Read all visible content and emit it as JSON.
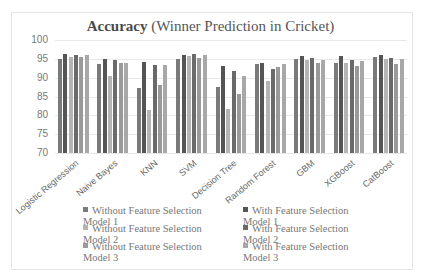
{
  "chart_data": {
    "type": "bar",
    "title": "Accuracy (Winner Prediction in Cricket)",
    "title_bold_part": "Accuracy",
    "title_rest": " (Winner Prediction in Cricket)",
    "xlabel": "",
    "ylabel": "",
    "ylim": [
      70,
      100
    ],
    "yticks": [
      70,
      75,
      80,
      85,
      90,
      95,
      100
    ],
    "grid": true,
    "legend_position": "bottom",
    "categories": [
      "Logistic Regression",
      "Naive Bayes",
      "KNN",
      "SVM",
      "Decision Tree",
      "Random Forest",
      "GBM",
      "XGBoost",
      "CatBoost"
    ],
    "series": [
      {
        "name": "Without Feature Selection Model 1",
        "color": "#7a7a7a",
        "values": [
          95.0,
          93.6,
          87.2,
          95.0,
          87.6,
          93.5,
          95.0,
          94.0,
          95.5
        ]
      },
      {
        "name": "With Feature Selection Model 1",
        "color": "#555555",
        "values": [
          96.3,
          95.0,
          94.2,
          96.0,
          93.0,
          94.0,
          95.8,
          95.8,
          95.9
        ]
      },
      {
        "name": "Without Feature Selection Model 2",
        "color": "#b5b5b5",
        "values": [
          95.4,
          90.5,
          81.4,
          95.8,
          81.6,
          89.0,
          94.7,
          94.0,
          94.9
        ]
      },
      {
        "name": "With Feature Selection Model 2",
        "color": "#6a6a6a",
        "values": [
          96.0,
          94.7,
          93.3,
          96.3,
          91.8,
          92.2,
          95.1,
          94.8,
          95.3
        ]
      },
      {
        "name": "Without Feature Selection Model 3",
        "color": "#9a9a9a",
        "values": [
          95.4,
          94.0,
          88.0,
          95.2,
          85.7,
          92.8,
          94.0,
          93.0,
          93.6
        ]
      },
      {
        "name": "With Feature Selection Model 3",
        "color": "#a8a8a8",
        "values": [
          96.0,
          94.0,
          93.4,
          96.0,
          90.5,
          93.5,
          94.6,
          94.5,
          95.0
        ]
      }
    ]
  }
}
